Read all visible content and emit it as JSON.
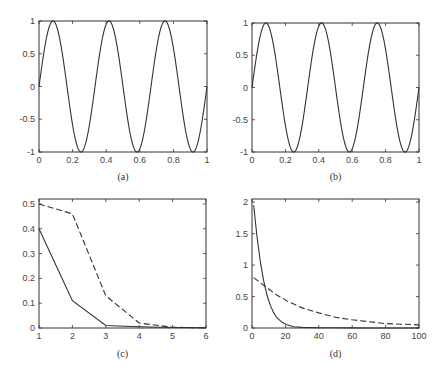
{
  "chart_data": [
    {
      "id": "a",
      "type": "line",
      "caption": "(a)",
      "title": "",
      "xlabel": "",
      "ylabel": "",
      "xlim": [
        0,
        1
      ],
      "ylim": [
        -1,
        1
      ],
      "xticks": [
        "0",
        "0.2",
        "0.4",
        "0.6",
        "0.8",
        "1"
      ],
      "yticks": [
        "-1",
        "-0.5",
        "0",
        "0.5",
        "1"
      ],
      "grid": false,
      "series": [
        {
          "name": "sin(6πx)",
          "style": "solid",
          "function": "sin(2*pi*3*x)",
          "cycles": 3
        }
      ]
    },
    {
      "id": "b",
      "type": "line",
      "caption": "(b)",
      "title": "",
      "xlabel": "",
      "ylabel": "",
      "xlim": [
        0,
        1
      ],
      "ylim": [
        -1,
        1
      ],
      "xticks": [
        "0",
        "0.2",
        "0.4",
        "0.6",
        "0.8",
        "1"
      ],
      "yticks": [
        "-1",
        "-0.5",
        "0",
        "0.5",
        "1"
      ],
      "grid": false,
      "series": [
        {
          "name": "sin(6πx) reconstruction",
          "style": "solid",
          "function": "sin(2*pi*3*x)",
          "cycles": 3
        }
      ]
    },
    {
      "id": "c",
      "type": "line",
      "caption": "(c)",
      "title": "",
      "xlabel": "",
      "ylabel": "",
      "xlim": [
        1,
        6
      ],
      "ylim": [
        0,
        0.52
      ],
      "xticks": [
        "1",
        "2",
        "3",
        "4",
        "5",
        "6"
      ],
      "yticks": [
        "0",
        "0.1",
        "0.2",
        "0.3",
        "0.4",
        "0.5"
      ],
      "grid": false,
      "x": [
        1,
        2,
        3,
        4,
        5,
        6
      ],
      "series": [
        {
          "name": "solid",
          "style": "solid",
          "values": [
            0.4,
            0.11,
            0.01,
            0.005,
            0.002,
            0.001
          ]
        },
        {
          "name": "dashed",
          "style": "dashed",
          "values": [
            0.5,
            0.46,
            0.13,
            0.02,
            0.003,
            0.001
          ]
        }
      ]
    },
    {
      "id": "d",
      "type": "line",
      "caption": "(d)",
      "title": "",
      "xlabel": "",
      "ylabel": "",
      "xlim": [
        0,
        100
      ],
      "ylim": [
        0,
        2.05
      ],
      "xticks": [
        "0",
        "20",
        "40",
        "60",
        "80",
        "100"
      ],
      "yticks": [
        "0",
        "0.5",
        "1",
        "1.5",
        "2"
      ],
      "grid": false,
      "x": [
        1,
        3,
        5,
        7,
        9,
        11,
        13,
        15,
        18,
        21,
        25,
        30,
        40,
        50,
        60,
        70,
        80,
        90,
        100
      ],
      "series": [
        {
          "name": "solid",
          "style": "solid",
          "values": [
            1.95,
            1.45,
            1.05,
            0.75,
            0.52,
            0.36,
            0.24,
            0.16,
            0.09,
            0.05,
            0.02,
            0.01,
            0.005,
            0.003,
            0.002,
            0.001,
            0.001,
            0.001,
            0.001
          ]
        },
        {
          "name": "dashed",
          "style": "dashed",
          "values": [
            0.8,
            0.76,
            0.72,
            0.68,
            0.64,
            0.6,
            0.56,
            0.52,
            0.48,
            0.43,
            0.38,
            0.32,
            0.24,
            0.17,
            0.13,
            0.1,
            0.07,
            0.06,
            0.05
          ]
        }
      ]
    }
  ],
  "layout": {
    "panels": {
      "a": {
        "x0": 39,
        "y0": 21,
        "x1": 207,
        "y1": 152,
        "caption_y": 180
      },
      "b": {
        "x0": 252,
        "y0": 23,
        "x1": 419,
        "y1": 152,
        "caption_y": 180
      },
      "c": {
        "x0": 39,
        "y0": 199,
        "x1": 206,
        "y1": 328,
        "caption_y": 357
      },
      "d": {
        "x0": 252,
        "y0": 199,
        "x1": 419,
        "y1": 328,
        "caption_y": 357
      }
    },
    "line_color": "#333333",
    "axis_color": "#333333"
  }
}
